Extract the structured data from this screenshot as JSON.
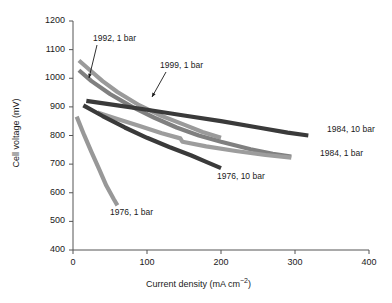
{
  "chart_data": {
    "type": "line",
    "title": "",
    "xlabel": "Current density (mA cm−2)",
    "ylabel": "Cell voltage (mV)",
    "xlim": [
      0,
      400
    ],
    "ylim": [
      400,
      1200
    ],
    "xticks": [
      0,
      100,
      200,
      300,
      400
    ],
    "yticks": [
      400,
      500,
      600,
      700,
      800,
      900,
      1000,
      1100,
      1200
    ],
    "grid": false,
    "legend": "inline-annotations",
    "series": [
      {
        "name": "1992, 1 bar",
        "color": "#9a9a9a",
        "label_position": "annotation-arrow-upper-left",
        "points": [
          [
            8,
            1062
          ],
          [
            20,
            1035
          ],
          [
            40,
            990
          ],
          [
            60,
            952
          ],
          [
            90,
            905
          ],
          [
            120,
            868
          ],
          [
            150,
            838
          ],
          [
            175,
            812
          ],
          [
            200,
            792
          ]
        ]
      },
      {
        "name": "1999, 1 bar",
        "color": "#808080",
        "label_position": "annotation-arrow-upper-middle",
        "points": [
          [
            8,
            1028
          ],
          [
            25,
            990
          ],
          [
            50,
            945
          ],
          [
            80,
            900
          ],
          [
            110,
            862
          ],
          [
            140,
            828
          ],
          [
            170,
            800
          ],
          [
            200,
            778
          ],
          [
            240,
            752
          ],
          [
            270,
            736
          ],
          [
            295,
            726
          ]
        ]
      },
      {
        "name": "1984, 10 bar",
        "color": "#3a3a3a",
        "label_position": "right-end",
        "points": [
          [
            18,
            921
          ],
          [
            60,
            905
          ],
          [
            100,
            890
          ],
          [
            150,
            870
          ],
          [
            200,
            850
          ],
          [
            250,
            828
          ],
          [
            290,
            810
          ],
          [
            318,
            800
          ]
        ]
      },
      {
        "name": "1984, 1 bar",
        "color": "#9d9d9d",
        "label_position": "right-end",
        "points": [
          [
            33,
            880
          ],
          [
            60,
            858
          ],
          [
            90,
            833
          ],
          [
            120,
            808
          ],
          [
            145,
            790
          ],
          [
            148,
            778
          ],
          [
            180,
            762
          ],
          [
            220,
            746
          ],
          [
            260,
            732
          ],
          [
            295,
            723
          ]
        ]
      },
      {
        "name": "1976, 10 bar",
        "color": "#3a3a3a",
        "label_position": "below-right-end",
        "points": [
          [
            14,
            905
          ],
          [
            40,
            868
          ],
          [
            70,
            828
          ],
          [
            100,
            792
          ],
          [
            130,
            760
          ],
          [
            160,
            730
          ],
          [
            180,
            708
          ],
          [
            200,
            686
          ]
        ]
      },
      {
        "name": "1976, 1 bar",
        "color": "#989898",
        "label_position": "below-end",
        "points": [
          [
            5,
            866
          ],
          [
            15,
            802
          ],
          [
            25,
            742
          ],
          [
            35,
            684
          ],
          [
            45,
            625
          ],
          [
            55,
            578
          ],
          [
            60,
            556
          ]
        ]
      }
    ]
  },
  "annotations": [
    {
      "text": "1992, 1 bar",
      "x": 93,
      "y": 33
    },
    {
      "text": "1999, 1 bar",
      "x": 160,
      "y": 60
    },
    {
      "text": "1984, 10 bar",
      "x": 327,
      "y": 124
    },
    {
      "text": "1984, 1 bar",
      "x": 320,
      "y": 148
    },
    {
      "text": "1976, 10 bar",
      "x": 217,
      "y": 171
    },
    {
      "text": "1976, 1 bar",
      "x": 110,
      "y": 207
    }
  ],
  "axis": {
    "x_label": "Current density (mA cm",
    "x_label_sup": "−2",
    "x_label_tail": ")",
    "y_label": "Cell voltage (mV)"
  }
}
